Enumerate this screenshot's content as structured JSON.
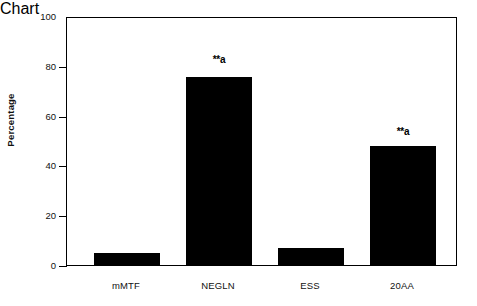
{
  "chart_data": {
    "type": "bar",
    "title": "",
    "xlabel": "",
    "ylabel": "Percentage",
    "categories": [
      "mMTF",
      "NEGLN",
      "ESS",
      "20AA"
    ],
    "values": [
      5,
      76,
      7,
      48
    ],
    "annotations": [
      "",
      "**a",
      "",
      "**a"
    ],
    "ylim": [
      0,
      100
    ],
    "yticks": [
      0,
      20,
      40,
      60,
      80,
      100
    ],
    "ytick_labels": [
      "0",
      "20",
      "40",
      "60",
      "80",
      "100"
    ],
    "grid": false,
    "legend": null,
    "bar_color": "#000000",
    "axis_color": "#000000",
    "background_color": "#ffffff"
  },
  "axis": {
    "y_title": "Percentage",
    "tick_0": "0",
    "tick_20": "20",
    "tick_40": "40",
    "tick_60": "60",
    "tick_80": "80",
    "tick_100": "100"
  },
  "bars": {
    "b0": {
      "label": "mMTF",
      "value": "5",
      "annotation": ""
    },
    "b1": {
      "label": "NEGLN",
      "value": "76",
      "annotation": "**a"
    },
    "b2": {
      "label": "ESS",
      "value": "7",
      "annotation": ""
    },
    "b3": {
      "label": "20AA",
      "value": "48",
      "annotation": "**a"
    }
  }
}
